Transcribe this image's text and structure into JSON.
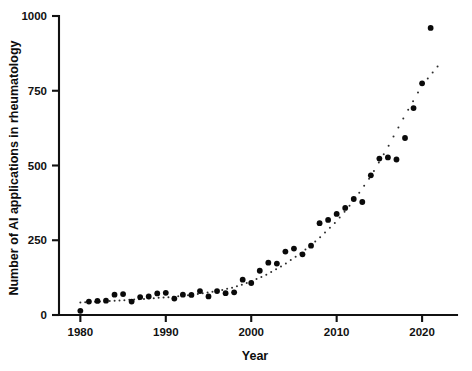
{
  "figure": {
    "width": 472,
    "height": 371,
    "background": "#ffffff",
    "point_color": "#0a0a0a",
    "fitline_color": "#2e2e2e"
  },
  "axes": {
    "x_title": "Year",
    "y_title": "Number of AI applications in rheumatology",
    "x_ticks": [
      "1980",
      "1990",
      "2000",
      "2010",
      "2020"
    ],
    "y_ticks": [
      "0",
      "250",
      "500",
      "750",
      "1000"
    ]
  },
  "chart_data": {
    "type": "scatter",
    "title": "",
    "xlabel": "Year",
    "ylabel": "Number of AI applications in rheumatology",
    "xlim": [
      1977.5,
      2023.5
    ],
    "ylim": [
      0,
      1000
    ],
    "xticks": [
      1980,
      1990,
      2000,
      2010,
      2020
    ],
    "yticks": [
      0,
      250,
      500,
      750,
      1000
    ],
    "grid": false,
    "legend": null,
    "series": [
      {
        "name": "Observed AI applications",
        "marker": "circle",
        "color": "#0a0a0a",
        "x": [
          1980,
          1981,
          1982,
          1983,
          1984,
          1985,
          1986,
          1987,
          1988,
          1989,
          1990,
          1991,
          1992,
          1993,
          1994,
          1995,
          1996,
          1997,
          1998,
          1999,
          2000,
          2001,
          2002,
          2003,
          2004,
          2005,
          2006,
          2007,
          2008,
          2009,
          2010,
          2011,
          2012,
          2013,
          2014,
          2015,
          2016,
          2017,
          2018,
          2019,
          2020,
          2021
        ],
        "y": [
          14,
          45,
          47,
          48,
          68,
          70,
          45,
          60,
          62,
          72,
          74,
          55,
          68,
          67,
          80,
          62,
          80,
          73,
          76,
          118,
          107,
          148,
          175,
          172,
          212,
          222,
          203,
          232,
          307,
          318,
          338,
          358,
          388,
          378,
          467,
          523,
          527,
          520,
          592,
          692,
          775,
          960
        ]
      },
      {
        "name": "Exponential fit (dotted)",
        "marker": "dotted-line",
        "color": "#2e2e2e",
        "x": [
          1980,
          1982,
          1984,
          1986,
          1988,
          1990,
          1992,
          1994,
          1996,
          1998,
          2000,
          2002,
          2004,
          2006,
          2008,
          2010,
          2012,
          2014,
          2016,
          2018,
          2020,
          2022
        ],
        "y": [
          42,
          45,
          48,
          51,
          55,
          59,
          64,
          71,
          80,
          93,
          112,
          138,
          171,
          211,
          258,
          314,
          382,
          464,
          562,
          668,
          768,
          838
        ]
      }
    ]
  }
}
